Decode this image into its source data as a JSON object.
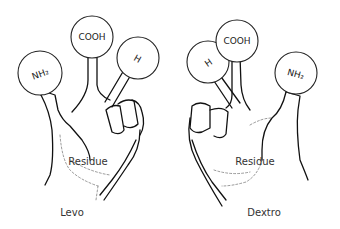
{
  "diagram": {
    "left_hand": {
      "caption": "Levo",
      "body_label": "Residue",
      "groups": [
        {
          "id": "nh2",
          "label": "NH₂"
        },
        {
          "id": "cooh",
          "label": "COOH"
        },
        {
          "id": "h",
          "label": "H"
        }
      ]
    },
    "right_hand": {
      "caption": "Dextro",
      "body_label": "Residue",
      "groups": [
        {
          "id": "h",
          "label": "H"
        },
        {
          "id": "cooh",
          "label": "COOH"
        },
        {
          "id": "nh2",
          "label": "NH₂"
        }
      ]
    },
    "colors": {
      "line": "#111111",
      "background": "#ffffff"
    }
  }
}
